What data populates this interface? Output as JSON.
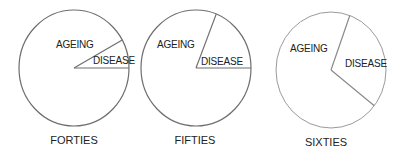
{
  "chart_data": [
    {
      "type": "pie",
      "title": "FORTIES",
      "categories": [
        "AGEING",
        "DISEASE"
      ],
      "values": [
        92,
        8
      ],
      "unit": "percent (estimated)"
    },
    {
      "type": "pie",
      "title": "FIFTIES",
      "categories": [
        "AGEING",
        "DISEASE"
      ],
      "values": [
        81,
        19
      ],
      "unit": "percent (estimated)"
    },
    {
      "type": "pie",
      "title": "SIXTIES",
      "categories": [
        "AGEING",
        "DISEASE"
      ],
      "values": [
        70,
        30
      ],
      "unit": "percent (estimated)"
    }
  ]
}
